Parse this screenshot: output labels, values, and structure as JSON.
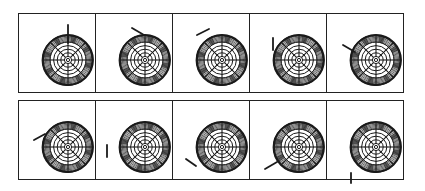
{
  "figure": {
    "rows": 2,
    "columns": 5,
    "colors": {
      "ink": "#1a1a1a",
      "background": "#ffffff"
    },
    "target": {
      "cx": 49,
      "cy": 46,
      "r": 25,
      "inner_rings": 5,
      "spokes": 8,
      "shaded_band_rings": 7
    },
    "panels": [
      {
        "row": 1,
        "col": 1,
        "marker": {
          "x1": 49,
          "y1": 11,
          "x2": 49,
          "y2": 29
        }
      },
      {
        "row": 1,
        "col": 2,
        "marker": {
          "x1": 36,
          "y1": 14,
          "x2": 48,
          "y2": 21
        }
      },
      {
        "row": 1,
        "col": 3,
        "marker": {
          "x1": 24,
          "y1": 21,
          "x2": 36,
          "y2": 15
        }
      },
      {
        "row": 1,
        "col": 4,
        "marker": {
          "x1": 23,
          "y1": 24,
          "x2": 23,
          "y2": 36
        }
      },
      {
        "row": 1,
        "col": 5,
        "marker": {
          "x1": 16,
          "y1": 31,
          "x2": 28,
          "y2": 38
        }
      },
      {
        "row": 2,
        "col": 1,
        "marker": {
          "x1": 15,
          "y1": 39,
          "x2": 26,
          "y2": 33
        }
      },
      {
        "row": 2,
        "col": 2,
        "marker": {
          "x1": 11,
          "y1": 44,
          "x2": 11,
          "y2": 56
        }
      },
      {
        "row": 2,
        "col": 3,
        "marker": {
          "x1": 13,
          "y1": 58,
          "x2": 23,
          "y2": 65
        }
      },
      {
        "row": 2,
        "col": 4,
        "marker": {
          "x1": 15,
          "y1": 68,
          "x2": 27,
          "y2": 61
        }
      },
      {
        "row": 2,
        "col": 5,
        "marker": {
          "x1": 24,
          "y1": 72,
          "x2": 24,
          "y2": 82
        }
      }
    ]
  }
}
